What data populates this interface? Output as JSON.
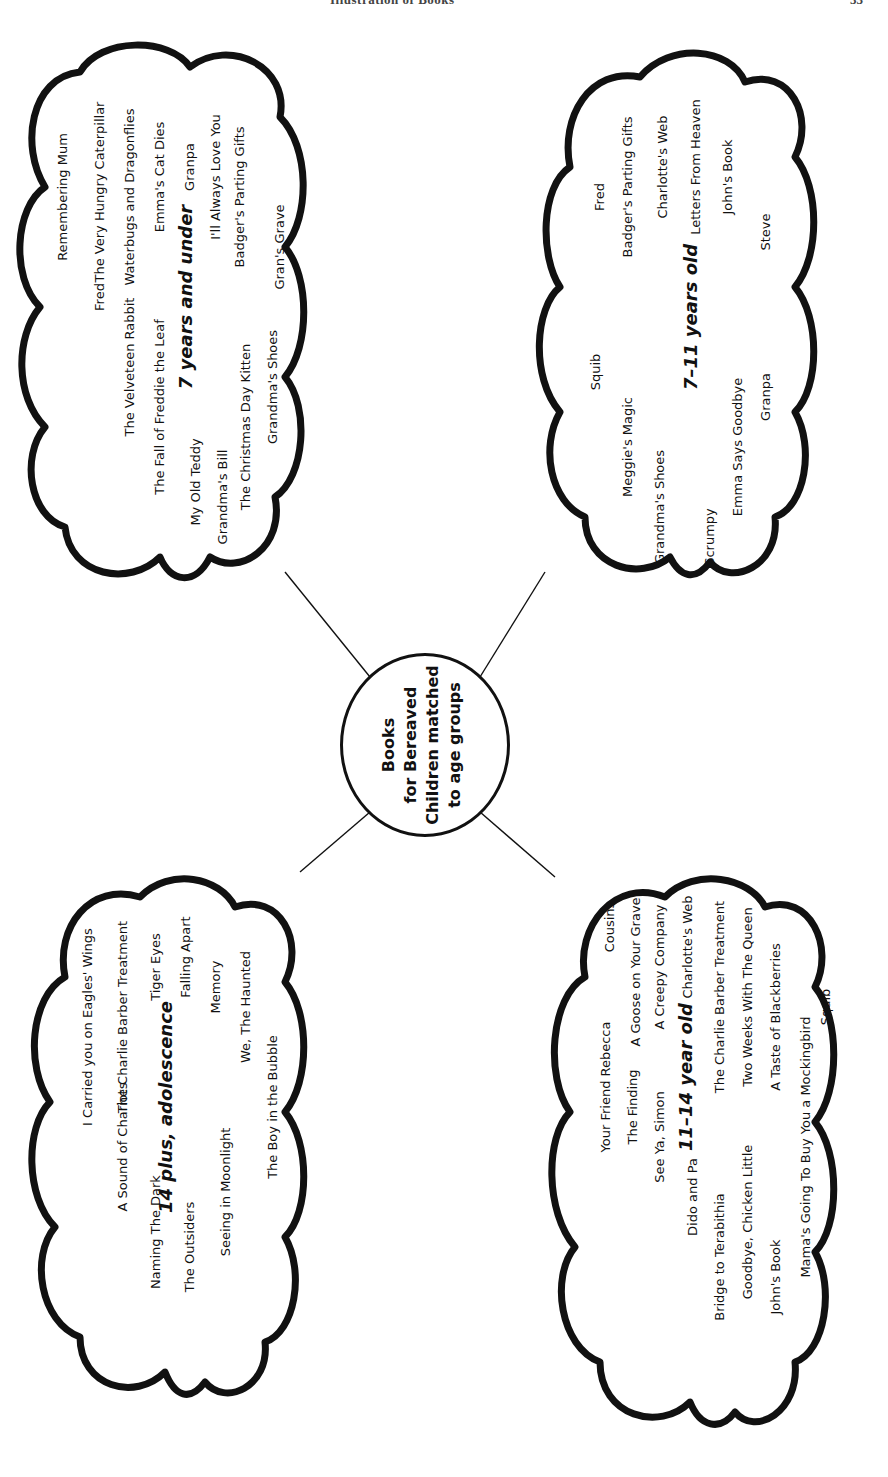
{
  "page_header": {
    "title": "Illustration of Books",
    "page_number": "33"
  },
  "center": {
    "lines": [
      "Books",
      "for Bereaved",
      "Children matched",
      "to age groups"
    ]
  },
  "groups": [
    {
      "id": "seven-and-under",
      "label": "7 years and under",
      "books": [
        "Remembering Mum",
        "Fred",
        "The Very Hungry Caterpillar",
        "Waterbugs and Dragonflies",
        "The Velveteen Rabbit",
        "Emma's Cat Dies",
        "The Fall of Freddie the Leaf",
        "Granpa",
        "My Old Teddy",
        "I'll Always Love You",
        "Grandma's Bill",
        "Badger's Parting Gifts",
        "The Christmas Day Kitten",
        "Grandma's Shoes",
        "Gran's Grave"
      ]
    },
    {
      "id": "seven-to-eleven",
      "label": "7–11 years old",
      "books": [
        "Fred",
        "Badger's Parting Gifts",
        "Charlotte's Web",
        "Letters From Heaven",
        "John's Book",
        "Squib",
        "Steve",
        "Meggie's Magic",
        "Grandma's Shoes",
        "Scrumpy",
        "Emma Says Goodbye",
        "Granpa"
      ]
    },
    {
      "id": "fourteen-plus",
      "label": "14 plus, adolescence",
      "books": [
        "I Carried you on Eagles' Wings",
        "The Charlie Barber Treatment",
        "A Sound of Chariots",
        "Tiger Eyes",
        "Falling Apart",
        "Naming The Dark",
        "Memory",
        "The Outsiders",
        "We, The Haunted",
        "Seeing in Moonlight",
        "The Boy in the Bubble"
      ]
    },
    {
      "id": "eleven-to-fourteen",
      "label": "11–14 year old",
      "books": [
        "Cousins",
        "A Goose on Your Grave",
        "Your Friend Rebecca",
        "A Creepy Company",
        "The Finding",
        "Charlotte's Web",
        "See Ya, Simon",
        "The Charlie Barber Treatment",
        "Dido and Pa",
        "Two Weeks With The Queen",
        "Bridge to Terabithia",
        "A Taste of Blackberries",
        "Goodbye, Chicken Little",
        "Mama's Going To Buy You a Mockingbird",
        "John's Book",
        "Squib"
      ]
    }
  ],
  "colors": {
    "ink": "#111111",
    "paper": "#ffffff"
  }
}
